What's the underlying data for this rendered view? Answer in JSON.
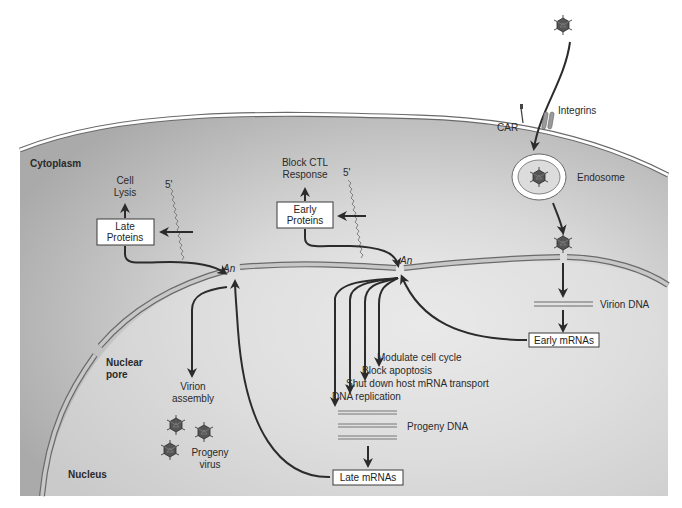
{
  "diagram": {
    "regions": {
      "cytoplasm": "Cytoplasm",
      "nucleus": "Nucleus",
      "nuclear_pore": [
        "Nuclear",
        "pore"
      ]
    },
    "entry": {
      "car": "CAR",
      "integrins": "Integrins",
      "endosome": "Endosome",
      "virion_dna": "Virion DNA"
    },
    "boxes": {
      "late_proteins": [
        "Late",
        "Proteins"
      ],
      "early_proteins": [
        "Early",
        "Proteins"
      ],
      "early_mrnas": "Early mRNAs",
      "late_mrnas": "Late mRNAs"
    },
    "outcomes": {
      "cell_lysis": [
        "Cell",
        "Lysis"
      ],
      "block_ctl": [
        "Block CTL",
        "Response"
      ],
      "virion_assembly": [
        "Virion",
        "assembly"
      ],
      "progeny_virus": [
        "Progeny",
        "virus"
      ],
      "progeny_dna": "Progeny DNA"
    },
    "early_functions": [
      "Modulate cell cycle",
      "Block apoptosis",
      "Shut down host mRNA transport",
      "DNA replication"
    ],
    "mrna_labels": {
      "five_prime": "5'",
      "poly_a": "An"
    },
    "colors": {
      "cell_fill": "#b9b9b9",
      "cell_light": "#e6e6e6",
      "membrane": "#ffffff",
      "outline": "#555555",
      "arrow": "#2b2b2b",
      "virus": "#4a4a4a"
    }
  }
}
